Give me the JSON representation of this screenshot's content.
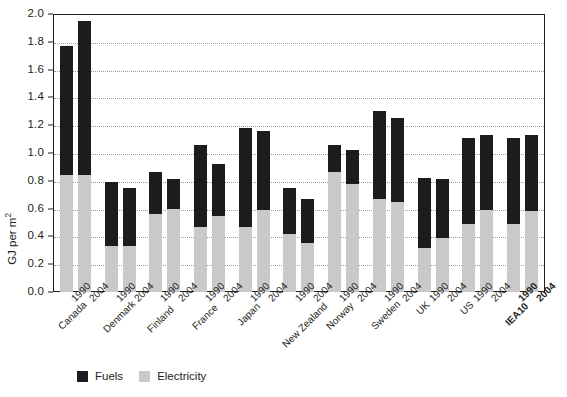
{
  "chart_data": {
    "type": "bar",
    "title": "",
    "subtitle": "",
    "xlabel": "",
    "ylabel": "GJ per m²",
    "ylim": [
      0.0,
      2.0
    ],
    "ytick_step": 0.2,
    "grid": true,
    "stacked": true,
    "legend_position": "bottom-left",
    "yticks": [
      "2.0",
      "1.8",
      "1.6",
      "1.4",
      "1.2",
      "1.0",
      "0.8",
      "0.6",
      "0.4",
      "0.2",
      "0.0"
    ],
    "ytick_values": [
      2.0,
      1.8,
      1.6,
      1.4,
      1.2,
      1.0,
      0.8,
      0.6,
      0.4,
      0.2,
      0.0
    ],
    "categories": [
      "Canada 1990",
      "Canada 2004",
      "Denmark 1990",
      "Denmark 2004",
      "Finland 1990",
      "Finland 2004",
      "France 1990",
      "France 2004",
      "Japan 1990",
      "Japan 2004",
      "New Zealand 1990",
      "New Zealand 2004",
      "Norway 1990",
      "Norway 2004",
      "Sweden 1990",
      "Sweden 2004",
      "UK 1990",
      "UK 2004",
      "US 1990",
      "US 2004",
      "IEA10 1990",
      "IEA10 2004"
    ],
    "series": [
      {
        "name": "Electricity",
        "color": "#c9c9c9",
        "values": [
          0.84,
          0.84,
          0.33,
          0.33,
          0.56,
          0.6,
          0.47,
          0.55,
          0.47,
          0.59,
          0.42,
          0.35,
          0.86,
          0.78,
          0.67,
          0.65,
          0.32,
          0.39,
          0.49,
          0.59,
          0.49,
          0.58
        ]
      },
      {
        "name": "Fuels",
        "color": "#1c1c1c",
        "values": [
          0.93,
          1.11,
          0.46,
          0.42,
          0.3,
          0.21,
          0.59,
          0.37,
          0.71,
          0.57,
          0.33,
          0.32,
          0.2,
          0.24,
          0.63,
          0.6,
          0.5,
          0.42,
          0.62,
          0.54,
          0.62,
          0.55
        ]
      }
    ],
    "totals": [
      1.77,
      1.95,
      0.79,
      0.75,
      0.86,
      0.81,
      1.06,
      0.92,
      1.18,
      1.16,
      0.75,
      0.67,
      1.06,
      1.02,
      1.3,
      1.25,
      0.82,
      0.81,
      1.11,
      1.13,
      1.11,
      1.13
    ],
    "groups": [
      {
        "country": "Canada",
        "bold": false,
        "years": [
          "1990",
          "2004"
        ]
      },
      {
        "country": "Denmark",
        "bold": false,
        "years": [
          "1990",
          "2004"
        ]
      },
      {
        "country": "Finland",
        "bold": false,
        "years": [
          "1990",
          "2004"
        ]
      },
      {
        "country": "France",
        "bold": false,
        "years": [
          "1990",
          "2004"
        ]
      },
      {
        "country": "Japan",
        "bold": false,
        "years": [
          "1990",
          "2004"
        ]
      },
      {
        "country": "New Zealand",
        "bold": false,
        "years": [
          "1990",
          "2004"
        ]
      },
      {
        "country": "Norway",
        "bold": false,
        "years": [
          "1990",
          "2004"
        ]
      },
      {
        "country": "Sweden",
        "bold": false,
        "years": [
          "1990",
          "2004"
        ]
      },
      {
        "country": "UK",
        "bold": false,
        "years": [
          "1990",
          "2004"
        ]
      },
      {
        "country": "US",
        "bold": false,
        "years": [
          "1990",
          "2004"
        ]
      },
      {
        "country": "IEA10",
        "bold": true,
        "years": [
          "1990",
          "2004"
        ]
      }
    ],
    "legend": [
      {
        "label": "Fuels",
        "color": "#1c1c1c"
      },
      {
        "label": "Electricity",
        "color": "#c9c9c9"
      }
    ]
  },
  "axis": {
    "y_title": "GJ per m",
    "y_title_sup": "2"
  }
}
